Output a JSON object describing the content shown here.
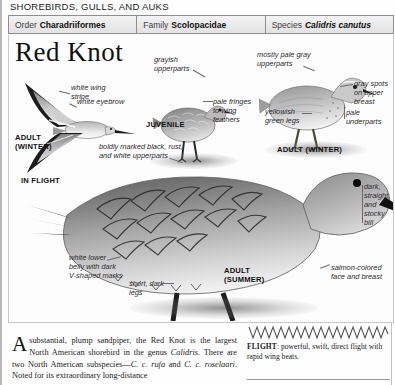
{
  "running_head": "SHOREBIRDS, GULLS, AND AUKS",
  "taxonomy": [
    {
      "key": "Order",
      "value": "Charadriiformes",
      "italic": false
    },
    {
      "key": "Family",
      "value": "Scolopacidae",
      "italic": false
    },
    {
      "key": "Species",
      "value": "Calidris canutus",
      "italic": true
    }
  ],
  "plate": {
    "title": "Red Knot",
    "callouts": [
      {
        "name": "white-wing-stripe",
        "text": "white wing\nstripe"
      },
      {
        "name": "white-eyebrow",
        "text": "white eyebrow"
      },
      {
        "name": "grayish-upperparts",
        "text": "grayish\nupperparts"
      },
      {
        "name": "pale-fringes",
        "text": "pale fringes\nto wing\nfeathers"
      },
      {
        "name": "mostly-pale-gray-upperparts",
        "text": "mostly pale gray\nupperparts"
      },
      {
        "name": "gray-spots-upper-breast",
        "text": "gray spots\non upper\nbreast"
      },
      {
        "name": "pale-underparts",
        "text": "pale\nunderparts"
      },
      {
        "name": "yellowish-green-legs",
        "text": "yellowish\ngreen legs"
      },
      {
        "name": "boldly-marked-upperparts",
        "text": "boldly marked black, rust,\nand white upperparts"
      },
      {
        "name": "dark-straight-stocky-bill",
        "text": "dark,\nstraight,\nand\nstocky\nbill"
      },
      {
        "name": "salmon-colored-face",
        "text": "salmon-colored\nface and breast"
      },
      {
        "name": "white-lower-belly",
        "text": "white lower\nbelly with dark\nV-shaped marks"
      },
      {
        "name": "short-dark-legs",
        "text": "short, dark\nlegs"
      }
    ],
    "captions": [
      {
        "name": "caption-adult-winter-flight",
        "text": "ADULT\n(WINTER)"
      },
      {
        "name": "caption-in-flight",
        "text": "IN FLIGHT"
      },
      {
        "name": "caption-juvenile",
        "text": "JUVENILE"
      },
      {
        "name": "caption-adult-winter",
        "text": "ADULT (WINTER)"
      },
      {
        "name": "caption-adult-summer",
        "text": "ADULT\n(SUMMER)"
      }
    ]
  },
  "body": {
    "dropcap": "A",
    "text_runs": [
      {
        "t": " substantial, plump sandpiper, the Red Knot is the largest North American shorebird in the genus ",
        "i": false
      },
      {
        "t": "Calidris",
        "i": true
      },
      {
        "t": ". There are two North American subspecies—",
        "i": false
      },
      {
        "t": "C. c. rufa",
        "i": true
      },
      {
        "t": " and ",
        "i": false
      },
      {
        "t": "C. c. roselaari",
        "i": true
      },
      {
        "t": ". Noted for its extraordinary long-distance",
        "i": false
      }
    ]
  },
  "flight": {
    "label": "FLIGHT",
    "description": ": powerful, swift, direct flight with rapid wing beats."
  },
  "colors": {
    "ink": "#1a1a1a",
    "rule": "#8e8e8e",
    "header_bg": "#ebebeb"
  }
}
